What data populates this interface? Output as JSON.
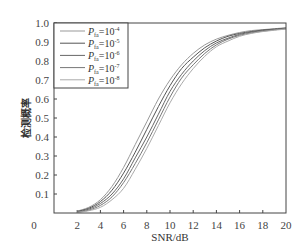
{
  "chart_data": {
    "type": "line",
    "title": "",
    "xlabel": "SNR/dB",
    "ylabel": "检测概率",
    "xlim": [
      0,
      20
    ],
    "ylim": [
      0,
      1.0
    ],
    "x_ticks": [
      "0",
      "2",
      "4",
      "6",
      "8",
      "10",
      "12",
      "14",
      "16",
      "18",
      "20"
    ],
    "y_ticks": [
      "0.1",
      "0.2",
      "0.3",
      "0.4",
      "0.5",
      "0.6",
      "0.7",
      "0.8",
      "0.9",
      "1.0"
    ],
    "grid": false,
    "legend_position": "upper-left",
    "x": [
      2,
      3,
      4,
      5,
      6,
      7,
      8,
      9,
      10,
      11,
      12,
      13,
      14,
      15,
      16,
      17,
      18,
      19,
      20
    ],
    "series": [
      {
        "name": "P_fa=10^-4",
        "label_sub": "fa",
        "label_exp": "-4",
        "values": [
          0.01,
          0.03,
          0.07,
          0.14,
          0.24,
          0.36,
          0.48,
          0.6,
          0.7,
          0.78,
          0.84,
          0.885,
          0.915,
          0.935,
          0.95,
          0.96,
          0.965,
          0.97,
          0.975
        ]
      },
      {
        "name": "P_fa=10^-5",
        "label_sub": "fa",
        "label_exp": "-5",
        "values": [
          0.008,
          0.025,
          0.06,
          0.12,
          0.21,
          0.32,
          0.44,
          0.56,
          0.67,
          0.76,
          0.82,
          0.87,
          0.905,
          0.93,
          0.945,
          0.955,
          0.963,
          0.968,
          0.973
        ]
      },
      {
        "name": "P_fa=10^-6",
        "label_sub": "fa",
        "label_exp": "-6",
        "values": [
          0.006,
          0.02,
          0.05,
          0.1,
          0.18,
          0.29,
          0.4,
          0.52,
          0.64,
          0.73,
          0.8,
          0.855,
          0.895,
          0.92,
          0.94,
          0.952,
          0.96,
          0.966,
          0.971
        ]
      },
      {
        "name": "P_fa=10^-7",
        "label_sub": "fa",
        "label_exp": "-7",
        "values": [
          0.004,
          0.015,
          0.04,
          0.085,
          0.16,
          0.26,
          0.37,
          0.49,
          0.61,
          0.71,
          0.78,
          0.84,
          0.885,
          0.915,
          0.935,
          0.948,
          0.957,
          0.964,
          0.97
        ]
      },
      {
        "name": "P_fa=10^-8",
        "label_sub": "fa",
        "label_exp": "-8",
        "values": [
          0.003,
          0.012,
          0.03,
          0.07,
          0.13,
          0.23,
          0.34,
          0.46,
          0.58,
          0.68,
          0.76,
          0.825,
          0.875,
          0.905,
          0.93,
          0.945,
          0.955,
          0.962,
          0.968
        ]
      }
    ],
    "line_colors": [
      "#999999",
      "#555555",
      "#666666",
      "#777777",
      "#aaaaaa"
    ],
    "frame_color": "#444444"
  }
}
